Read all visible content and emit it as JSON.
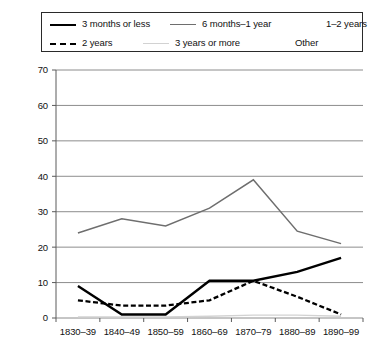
{
  "legend": {
    "items": [
      {
        "label": "3 months or less",
        "style": "solid-black",
        "row": 0,
        "x": 8
      },
      {
        "label": "6 months–1 year",
        "style": "solid-gray",
        "row": 0,
        "x": 128
      },
      {
        "label": "1–2 years",
        "style": "none",
        "row": 0,
        "x": 252
      },
      {
        "label": "2 years",
        "style": "dashed-black",
        "row": 1,
        "x": 8
      },
      {
        "label": "3 years or more",
        "style": "solid-lightgray",
        "row": 1,
        "x": 101
      },
      {
        "label": "Other",
        "style": "none",
        "row": 1,
        "x": 221
      }
    ]
  },
  "chart_data": {
    "type": "line",
    "title": "",
    "xlabel": "",
    "ylabel": "",
    "ylim": [
      0,
      70
    ],
    "yticks": [
      0,
      10,
      20,
      30,
      40,
      50,
      60,
      70
    ],
    "grid": true,
    "legend_position": "top",
    "categories": [
      "1830–39",
      "1840–49",
      "1850–59",
      "1860–69",
      "1870–79",
      "1880–89",
      "1890–99"
    ],
    "series": [
      {
        "name": "3 months or less",
        "style": "solid-black",
        "color": "#000000",
        "values": [
          9,
          1,
          1,
          10.5,
          10.5,
          13,
          17
        ]
      },
      {
        "name": "6 months–1 year",
        "style": "solid-gray",
        "color": "#6e6e6e",
        "values": [
          24,
          28,
          26,
          31,
          39,
          24.5,
          21
        ]
      },
      {
        "name": "1–2 years",
        "style": "none",
        "color": "#ffffff",
        "values": [
          null,
          null,
          null,
          null,
          null,
          null,
          null
        ]
      },
      {
        "name": "2 years",
        "style": "dashed-black",
        "color": "#000000",
        "values": [
          5,
          3.5,
          3.5,
          5,
          10.5,
          6,
          1
        ]
      },
      {
        "name": "3 years or more",
        "style": "solid-lightgray",
        "color": "#d2d2d2",
        "values": [
          0.3,
          0.3,
          0.3,
          0.5,
          0.8,
          0.8,
          0.5
        ]
      },
      {
        "name": "Other",
        "style": "none",
        "color": "#ffffff",
        "values": [
          null,
          null,
          null,
          null,
          null,
          null,
          null
        ]
      }
    ]
  }
}
